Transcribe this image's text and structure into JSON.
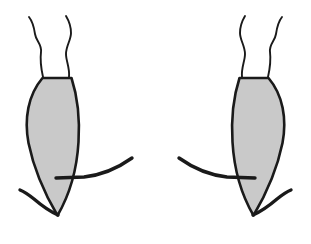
{
  "canvas": {
    "width": 311,
    "height": 244,
    "background_color": "#ffffff",
    "title": "Pair of mirrored insect outline drawings"
  },
  "style": {
    "body_fill_color": "#c9c9c9",
    "outline_color": "#1a1a1a",
    "body_stroke_width": 2.6,
    "antenna_stroke_width": 1.9,
    "leg_stroke_width": 3.4
  },
  "figures": [
    {
      "id": "left-insect",
      "name": "left-insect",
      "orientation": "mirrored-left",
      "body": {
        "name": "left-insect-body",
        "shape": "leaf-teardrop",
        "top_y": 78,
        "tip_y": 216,
        "left_x": 26,
        "right_x": 80,
        "top_width": 30,
        "max_width": 54,
        "path": "M 42.5 78 L 71.5 78 C 77 95 80 118 78.5 142 C 77 168 70 194 57.5 215.5 C 46 196 34 170 28.5 143 C 24 119 28 95 42.5 78 Z"
      },
      "antennae": [
        {
          "name": "left-insect-antenna-outer",
          "path": "M 43 77 C 41 68 40 60 41 52 C 42 44 36 41 35 34 C 34 27 33 22 29 17"
        },
        {
          "name": "left-insect-antenna-inner",
          "path": "M 69 77 C 70 68 66 61 66 54 C 66 46 71 40 71 33 C 71 26 69 21 66 16"
        }
      ],
      "legs": [
        {
          "name": "left-insect-upper-leg",
          "path": "M 56 178 L 84 177 C 102 175 118 168 132 158"
        },
        {
          "name": "left-insect-lower-leg",
          "path": "M 58 215 C 49 211 41 205 34 199 C 29 195 25 192 20 190"
        }
      ]
    },
    {
      "id": "right-insect",
      "name": "right-insect",
      "orientation": "mirrored-right",
      "body": {
        "name": "right-insect-body",
        "shape": "leaf-teardrop",
        "top_y": 78,
        "tip_y": 216,
        "left_x": 231,
        "right_x": 285,
        "top_width": 30,
        "max_width": 54,
        "path": "M 239.5 78 L 268.5 78 C 283 95 287 119 282.5 143 C 277 170 265 196 253.5 215.5 C 241 194 234 168 232.5 142 C 231 118 234 95 239.5 78 Z"
      },
      "antennae": [
        {
          "name": "right-insect-antenna-inner",
          "path": "M 242 77 C 241 68 245 61 245 54 C 245 46 240 40 240 33 C 240 26 242 21 245 16"
        },
        {
          "name": "right-insect-antenna-outer",
          "path": "M 268 77 C 270 68 271 60 270 52 C 269 44 275 41 276 34 C 277 27 278 22 282 17"
        }
      ],
      "legs": [
        {
          "name": "right-insect-upper-leg",
          "path": "M 255 178 L 227 177 C 209 175 193 168 179 158"
        },
        {
          "name": "right-insect-lower-leg",
          "path": "M 253 215 C 262 211 270 205 277 199 C 282 195 286 192 291 190"
        }
      ]
    }
  ]
}
